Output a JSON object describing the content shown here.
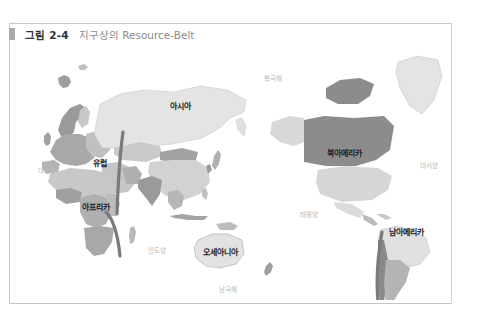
{
  "figure": {
    "number": "그림 2-4",
    "title": "지구상의 Resource-Belt"
  },
  "map": {
    "projection": "Pacific-centered world map",
    "continents": [
      {
        "id": "europe",
        "label": "유럽"
      },
      {
        "id": "asia",
        "label": "아시아"
      },
      {
        "id": "africa",
        "label": "아프리카"
      },
      {
        "id": "oceania",
        "label": "오세아니아"
      },
      {
        "id": "north_america",
        "label": "북아메리카"
      },
      {
        "id": "south_america",
        "label": "남아메리카"
      }
    ],
    "oceans": [
      {
        "id": "arctic",
        "label": "북극해"
      },
      {
        "id": "atlantic_west",
        "label": "대서양"
      },
      {
        "id": "atlantic_east",
        "label": "대서양"
      },
      {
        "id": "pacific",
        "label": "태평양"
      },
      {
        "id": "indian",
        "label": "인도양"
      },
      {
        "id": "southern",
        "label": "남극해"
      }
    ],
    "resource_belts": [
      {
        "id": "eurasia_belt",
        "description": "Vertical belt from Russia through Middle East to East Africa"
      },
      {
        "id": "africa_belt",
        "description": "Belt through Central/Southern Africa"
      },
      {
        "id": "americas_belt",
        "description": "Belt along Andes of South America"
      }
    ],
    "colors": {
      "land_light": "#e8e8e8",
      "land_mid": "#c4c4c4",
      "land_dark": "#9c9c9c",
      "land_darker": "#8a8a8a",
      "belt": "#7a7a7a",
      "ocean": "#ffffff"
    }
  }
}
